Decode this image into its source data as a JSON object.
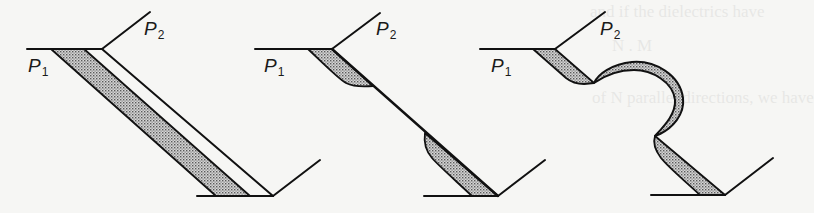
{
  "figure": {
    "panels": [
      {
        "id": "panel-1",
        "p1_label": "P",
        "p1_sub": "1",
        "p2_label": "P",
        "p2_sub": "2"
      },
      {
        "id": "panel-2",
        "p1_label": "P",
        "p1_sub": "1",
        "p2_label": "P",
        "p2_sub": "2"
      },
      {
        "id": "panel-3",
        "p1_label": "P",
        "p1_sub": "1",
        "p2_label": "P",
        "p2_sub": "2"
      }
    ],
    "colors": {
      "stroke": "#111111",
      "shade": "#b8b8b8",
      "paper": "#f6f6f4"
    }
  },
  "bleed_through": {
    "line1": "and if the dielectrics have",
    "line2": "N . M",
    "line3": "of N parallel directions, we have"
  }
}
